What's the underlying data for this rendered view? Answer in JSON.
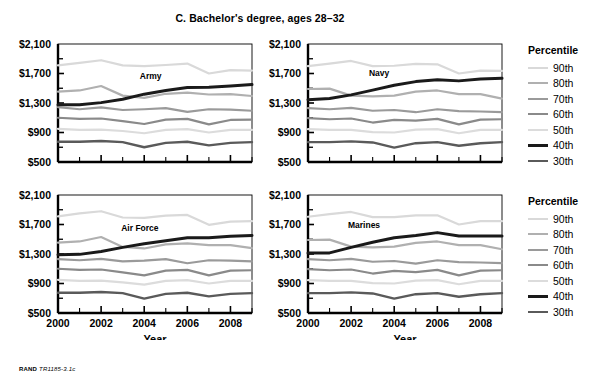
{
  "figure": {
    "title": "C. Bachelor's degree, ages 28–32",
    "footer_brand": "RAND",
    "footer_code": "TR1185-3.1c"
  },
  "legend": {
    "title": "Percentile",
    "items": [
      {
        "label": "90th",
        "color": "#d9d9d9",
        "width": 2.2
      },
      {
        "label": "80th",
        "color": "#b0b0b0",
        "width": 2.2
      },
      {
        "label": "70th",
        "color": "#9a9a9a",
        "width": 2.2
      },
      {
        "label": "60th",
        "color": "#8a8a8a",
        "width": 2.2
      },
      {
        "label": "50th",
        "color": "#dcdcdc",
        "width": 2.2
      },
      {
        "label": "40th",
        "color": "#1a1a1a",
        "width": 3.0
      },
      {
        "label": "30th",
        "color": "#5a5a5a",
        "width": 2.4
      }
    ]
  },
  "chart_data": [
    {
      "type": "line",
      "title": "Army",
      "panel": "top-left",
      "xlabel": "",
      "ylabel": "",
      "x": [
        2000,
        2001,
        2002,
        2003,
        2004,
        2005,
        2006,
        2007,
        2008,
        2009
      ],
      "xticks": [
        2000,
        2002,
        2004,
        2006,
        2008
      ],
      "xlim": [
        2000,
        2009
      ],
      "ylim": [
        500,
        2100
      ],
      "yticks": [
        500,
        900,
        1300,
        1700,
        2100
      ],
      "ytick_labels": [
        "$500",
        "$900",
        "$1,300",
        "$1,700",
        "$2,100"
      ],
      "grid": false,
      "series": [
        {
          "name": "90th",
          "values": [
            1810,
            1845,
            1880,
            1810,
            1800,
            1815,
            1835,
            1700,
            1745,
            1740
          ]
        },
        {
          "name": "80th",
          "values": [
            1455,
            1470,
            1530,
            1400,
            1370,
            1425,
            1440,
            1415,
            1420,
            1395
          ]
        },
        {
          "name": "70th",
          "values": [
            1245,
            1215,
            1240,
            1205,
            1215,
            1230,
            1180,
            1215,
            1210,
            1195
          ]
        },
        {
          "name": "60th",
          "values": [
            1100,
            1085,
            1090,
            1055,
            1015,
            1075,
            1085,
            1010,
            1070,
            1075
          ]
        },
        {
          "name": "50th",
          "values": [
            950,
            935,
            940,
            920,
            890,
            935,
            945,
            900,
            935,
            935
          ]
        },
        {
          "name": "40th",
          "values": [
            1275,
            1275,
            1305,
            1350,
            1420,
            1470,
            1510,
            1515,
            1530,
            1550
          ]
        },
        {
          "name": "30th",
          "values": [
            775,
            775,
            785,
            770,
            700,
            760,
            775,
            725,
            760,
            770
          ]
        }
      ],
      "annotations": [
        {
          "text": "Army",
          "x": 2004.3,
          "y": 1620
        }
      ],
      "emphasis_series": "40th"
    },
    {
      "type": "line",
      "title": "Navy",
      "panel": "top-right",
      "xlabel": "",
      "ylabel": "",
      "x": [
        2000,
        2001,
        2002,
        2003,
        2004,
        2005,
        2006,
        2007,
        2008,
        2009
      ],
      "xticks": [
        2000,
        2002,
        2004,
        2006,
        2008
      ],
      "xlim": [
        2000,
        2009
      ],
      "ylim": [
        500,
        2100
      ],
      "yticks": [
        500,
        900,
        1300,
        1700,
        2100
      ],
      "ytick_labels": [
        "$500",
        "$900",
        "$1,300",
        "$1,700",
        "$2,100"
      ],
      "grid": false,
      "series": [
        {
          "name": "90th",
          "values": [
            1800,
            1835,
            1870,
            1800,
            1805,
            1830,
            1825,
            1700,
            1740,
            1735
          ]
        },
        {
          "name": "80th",
          "values": [
            1490,
            1495,
            1400,
            1390,
            1400,
            1455,
            1470,
            1420,
            1420,
            1360
          ]
        },
        {
          "name": "70th",
          "values": [
            1230,
            1215,
            1235,
            1195,
            1205,
            1175,
            1215,
            1190,
            1185,
            1175
          ]
        },
        {
          "name": "60th",
          "values": [
            1095,
            1080,
            1090,
            1035,
            1070,
            1060,
            1085,
            1010,
            1075,
            1080
          ]
        },
        {
          "name": "50th",
          "values": [
            945,
            935,
            935,
            905,
            900,
            940,
            945,
            890,
            935,
            935
          ]
        },
        {
          "name": "40th",
          "values": [
            1345,
            1360,
            1410,
            1475,
            1540,
            1590,
            1615,
            1600,
            1625,
            1635
          ]
        },
        {
          "name": "30th",
          "values": [
            770,
            770,
            780,
            765,
            695,
            755,
            770,
            720,
            755,
            770
          ]
        }
      ],
      "annotations": [
        {
          "text": "Navy",
          "x": 2003.3,
          "y": 1665
        }
      ],
      "emphasis_series": "40th"
    },
    {
      "type": "line",
      "title": "Air Force",
      "panel": "bottom-left",
      "xlabel": "Year",
      "ylabel": "",
      "x": [
        2000,
        2001,
        2002,
        2003,
        2004,
        2005,
        2006,
        2007,
        2008,
        2009
      ],
      "xticks": [
        2000,
        2002,
        2004,
        2006,
        2008
      ],
      "xlim": [
        2000,
        2009
      ],
      "ylim": [
        500,
        2100
      ],
      "yticks": [
        500,
        900,
        1300,
        1700,
        2100
      ],
      "ytick_labels": [
        "$500",
        "$900",
        "$1,300",
        "$1,700",
        "$2,100"
      ],
      "grid": false,
      "series": [
        {
          "name": "90th",
          "values": [
            1810,
            1850,
            1880,
            1795,
            1790,
            1820,
            1830,
            1695,
            1740,
            1745
          ]
        },
        {
          "name": "80th",
          "values": [
            1455,
            1470,
            1530,
            1395,
            1375,
            1430,
            1445,
            1420,
            1420,
            1380
          ]
        },
        {
          "name": "70th",
          "values": [
            1230,
            1215,
            1235,
            1200,
            1210,
            1230,
            1175,
            1215,
            1210,
            1200
          ]
        },
        {
          "name": "60th",
          "values": [
            1100,
            1085,
            1090,
            1050,
            1010,
            1075,
            1085,
            1010,
            1075,
            1080
          ]
        },
        {
          "name": "50th",
          "values": [
            950,
            935,
            940,
            915,
            885,
            935,
            945,
            900,
            935,
            935
          ]
        },
        {
          "name": "40th",
          "values": [
            1290,
            1295,
            1335,
            1390,
            1440,
            1480,
            1520,
            1520,
            1540,
            1550
          ]
        },
        {
          "name": "30th",
          "values": [
            775,
            775,
            785,
            770,
            695,
            760,
            775,
            725,
            760,
            770
          ]
        }
      ],
      "annotations": [
        {
          "text": "Air Force",
          "x": 2003.8,
          "y": 1610
        }
      ],
      "emphasis_series": "40th"
    },
    {
      "type": "line",
      "title": "Marines",
      "panel": "bottom-right",
      "xlabel": "Year",
      "ylabel": "",
      "x": [
        2000,
        2001,
        2002,
        2003,
        2004,
        2005,
        2006,
        2007,
        2008,
        2009
      ],
      "xticks": [
        2000,
        2002,
        2004,
        2006,
        2008
      ],
      "xlim": [
        2000,
        2009
      ],
      "ylim": [
        500,
        2100
      ],
      "yticks": [
        500,
        900,
        1300,
        1700,
        2100
      ],
      "ytick_labels": [
        "$500",
        "$900",
        "$1,300",
        "$1,700",
        "$2,100"
      ],
      "grid": false,
      "series": [
        {
          "name": "90th",
          "values": [
            1805,
            1840,
            1870,
            1800,
            1800,
            1825,
            1825,
            1700,
            1745,
            1745
          ]
        },
        {
          "name": "80th",
          "values": [
            1490,
            1495,
            1400,
            1390,
            1400,
            1450,
            1470,
            1420,
            1420,
            1365
          ]
        },
        {
          "name": "70th",
          "values": [
            1230,
            1215,
            1235,
            1195,
            1205,
            1170,
            1215,
            1190,
            1185,
            1175
          ]
        },
        {
          "name": "60th",
          "values": [
            1095,
            1080,
            1090,
            1035,
            1070,
            1055,
            1085,
            1010,
            1075,
            1080
          ]
        },
        {
          "name": "50th",
          "values": [
            945,
            935,
            935,
            905,
            900,
            940,
            945,
            890,
            935,
            935
          ]
        },
        {
          "name": "40th",
          "values": [
            1315,
            1315,
            1390,
            1460,
            1520,
            1550,
            1590,
            1545,
            1545,
            1545
          ]
        },
        {
          "name": "30th",
          "values": [
            770,
            770,
            780,
            765,
            695,
            755,
            770,
            720,
            755,
            770
          ]
        }
      ],
      "annotations": [
        {
          "text": "Marines",
          "x": 2002.6,
          "y": 1655
        }
      ],
      "emphasis_series": "40th"
    }
  ]
}
